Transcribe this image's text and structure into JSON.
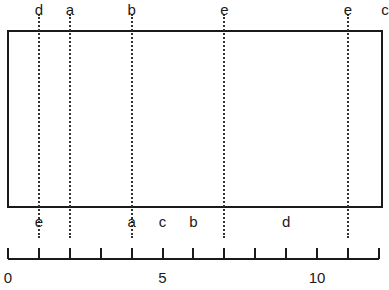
{
  "diagram": {
    "scale": {
      "min": 0,
      "max": 12,
      "px_per_unit": 30.9,
      "origin_px": 8,
      "labeled_ticks": [
        {
          "value": 0,
          "label": "0"
        },
        {
          "value": 5,
          "label": "5"
        },
        {
          "value": 10,
          "label": "10"
        }
      ]
    },
    "top_labels": [
      {
        "pos": 1,
        "label": "d"
      },
      {
        "pos": 2,
        "label": "a"
      },
      {
        "pos": 4,
        "label": "b"
      },
      {
        "pos": 7,
        "label": "e"
      },
      {
        "pos": 11,
        "label": "e"
      },
      {
        "pos": 12.2,
        "label": "c"
      }
    ],
    "bottom_labels": [
      {
        "pos": 1,
        "label": "e"
      },
      {
        "pos": 4,
        "label": "a"
      },
      {
        "pos": 5,
        "label": "c"
      },
      {
        "pos": 6,
        "label": "b"
      },
      {
        "pos": 9,
        "label": "d"
      }
    ],
    "dotted_lines": [
      1,
      2,
      4,
      7,
      11
    ]
  }
}
